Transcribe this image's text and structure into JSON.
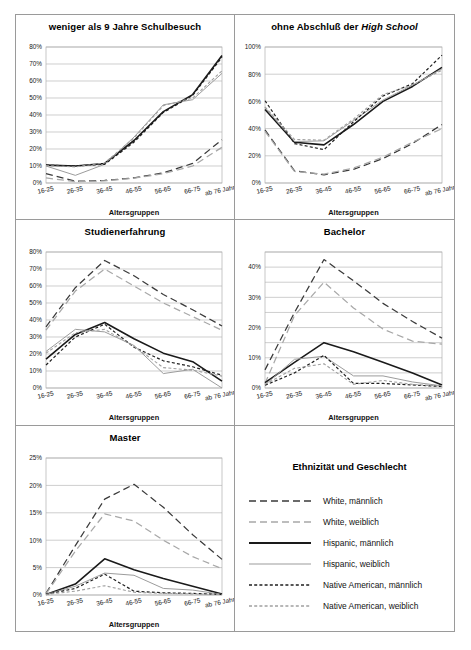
{
  "figure": {
    "axis_caption": "Altersgruppen",
    "categories": [
      "16-25",
      "26-35",
      "36-45",
      "46-55",
      "56-65",
      "66-75",
      "ab 76 Jahre"
    ],
    "series_styles": [
      {
        "key": "white_m",
        "label": "White, männlich",
        "color": "#3a3a3a",
        "width": 1.25,
        "dash": "7,4"
      },
      {
        "key": "white_w",
        "label": "White, weiblich",
        "color": "#a8a8a8",
        "width": 1.25,
        "dash": "7,4"
      },
      {
        "key": "hisp_m",
        "label": "Hispanic, männlich",
        "color": "#1a1a1a",
        "width": 1.6,
        "dash": "none"
      },
      {
        "key": "hisp_w",
        "label": "Hispanic, weiblich",
        "color": "#9c9c9c",
        "width": 1.0,
        "dash": "none"
      },
      {
        "key": "native_m",
        "label": "Native American, männlich",
        "color": "#1f1f1f",
        "width": 1.2,
        "dash": "3,2.2"
      },
      {
        "key": "native_w",
        "label": "Native American, weiblich",
        "color": "#a0a0a0",
        "width": 1.1,
        "dash": "3,2.2"
      }
    ]
  },
  "legend": {
    "title": "Ethnizität und Geschlecht",
    "items": [
      "White, männlich",
      "White, weiblich",
      "Hispanic, männlich",
      "Hispanic, weiblich",
      "Native American, männlich",
      "Native American, weiblich"
    ]
  },
  "chart_data": [
    {
      "id": "schulbesuch",
      "type": "line",
      "title": "weniger als 9 Jahre Schulbesuch",
      "title_italic_part": "",
      "xlabel": "Altersgruppen",
      "ylabel": "",
      "categories": [
        "16-25",
        "26-35",
        "36-45",
        "46-55",
        "56-65",
        "66-75",
        "ab 76 Jahre"
      ],
      "ylim": [
        0,
        80
      ],
      "yticks": [
        0,
        10,
        20,
        30,
        40,
        50,
        60,
        70,
        80
      ],
      "ytick_labels": [
        "0%",
        "10%",
        "20%",
        "30%",
        "40%",
        "50%",
        "60%",
        "70%",
        "80%"
      ],
      "grid": true,
      "series": [
        {
          "name": "White, männlich",
          "key": "white_m",
          "values": [
            5.5,
            1.0,
            1.5,
            3.0,
            6.0,
            11.5,
            25.5
          ]
        },
        {
          "name": "White, weiblich",
          "key": "white_w",
          "values": [
            3.0,
            0.8,
            1.3,
            2.8,
            5.5,
            10.0,
            21.0
          ]
        },
        {
          "name": "Hispanic, männlich",
          "key": "hisp_m",
          "values": [
            10.5,
            10.0,
            11.5,
            25.0,
            42.0,
            52.0,
            75.0
          ]
        },
        {
          "name": "Hispanic, weiblich",
          "key": "hisp_w",
          "values": [
            10.0,
            4.5,
            11.0,
            27.0,
            46.0,
            49.0,
            64.5
          ]
        },
        {
          "name": "Native American, männlich",
          "key": "native_m",
          "values": [
            10.5,
            10.0,
            11.0,
            24.0,
            41.5,
            51.5,
            74.0
          ]
        },
        {
          "name": "Native American, weiblich",
          "key": "native_w",
          "values": [
            10.2,
            9.5,
            11.8,
            26.5,
            45.5,
            50.0,
            66.0
          ]
        }
      ]
    },
    {
      "id": "highschool",
      "type": "line",
      "title": "ohne Abschluß der ",
      "title_italic_part": "High School",
      "xlabel": "Altersgruppen",
      "ylabel": "",
      "categories": [
        "16-25",
        "26-35",
        "36-45",
        "46-55",
        "56-65",
        "66-75",
        "ab 76 Jahre"
      ],
      "ylim": [
        0,
        100
      ],
      "yticks": [
        0,
        20,
        40,
        60,
        80,
        100
      ],
      "ytick_labels": [
        "0%",
        "20%",
        "40%",
        "60%",
        "80%",
        "100%"
      ],
      "grid": true,
      "series": [
        {
          "name": "White, männlich",
          "key": "white_m",
          "values": [
            39.0,
            9.0,
            6.0,
            10.0,
            18.0,
            29.0,
            43.0
          ]
        },
        {
          "name": "White, weiblich",
          "key": "white_w",
          "values": [
            38.0,
            8.5,
            6.5,
            11.0,
            19.0,
            30.0,
            40.0
          ]
        },
        {
          "name": "Hispanic, männlich",
          "key": "hisp_m",
          "values": [
            54.0,
            30.0,
            28.0,
            43.0,
            60.0,
            71.0,
            85.0
          ]
        },
        {
          "name": "Hispanic, weiblich",
          "key": "hisp_w",
          "values": [
            55.5,
            30.5,
            31.0,
            46.0,
            61.0,
            72.0,
            84.0
          ]
        },
        {
          "name": "Native American, männlich",
          "key": "native_m",
          "values": [
            60.5,
            29.0,
            24.5,
            45.0,
            64.0,
            73.0,
            94.0
          ]
        },
        {
          "name": "Native American, weiblich",
          "key": "native_w",
          "values": [
            56.0,
            32.0,
            31.5,
            47.0,
            65.0,
            72.0,
            83.0
          ]
        }
      ]
    },
    {
      "id": "studienerfahrung",
      "type": "line",
      "title": "Studienerfahrung",
      "title_italic_part": "",
      "xlabel": "Altersgruppen",
      "ylabel": "",
      "categories": [
        "16-25",
        "26-35",
        "36-45",
        "46-55",
        "56-65",
        "66-75",
        "ab 76 Jahre"
      ],
      "ylim": [
        0,
        80
      ],
      "yticks": [
        0,
        10,
        20,
        30,
        40,
        50,
        60,
        70,
        80
      ],
      "ytick_labels": [
        "0%",
        "10%",
        "20%",
        "30%",
        "40%",
        "50%",
        "60%",
        "70%",
        "80%"
      ],
      "grid": true,
      "series": [
        {
          "name": "White, männlich",
          "key": "white_m",
          "values": [
            36.0,
            59.0,
            75.0,
            66.0,
            55.0,
            46.0,
            36.5
          ]
        },
        {
          "name": "White, weiblich",
          "key": "white_w",
          "values": [
            34.0,
            57.0,
            70.0,
            60.0,
            50.0,
            42.0,
            34.0
          ]
        },
        {
          "name": "Hispanic, männlich",
          "key": "hisp_m",
          "values": [
            17.0,
            31.5,
            38.5,
            29.0,
            20.5,
            15.5,
            4.0
          ]
        },
        {
          "name": "Hispanic, weiblich",
          "key": "hisp_w",
          "values": [
            21.5,
            34.5,
            33.0,
            25.0,
            8.5,
            11.0,
            0.0
          ]
        },
        {
          "name": "Native American, männlich",
          "key": "native_m",
          "values": [
            13.5,
            30.0,
            37.5,
            24.0,
            16.0,
            12.5,
            7.5
          ]
        },
        {
          "name": "Native American, weiblich",
          "key": "native_w",
          "values": [
            20.5,
            32.5,
            34.5,
            24.5,
            12.0,
            10.5,
            7.0
          ]
        }
      ]
    },
    {
      "id": "bachelor",
      "type": "line",
      "title": "Bachelor",
      "title_italic_part": "",
      "xlabel": "Altersgruppen",
      "ylabel": "",
      "categories": [
        "16-25",
        "26-35",
        "36-45",
        "46-55",
        "56-65",
        "66-75",
        "ab 76 Jahre"
      ],
      "ylim": [
        0,
        45
      ],
      "yticks": [
        0,
        5,
        10,
        15,
        20,
        25,
        30,
        35,
        40,
        45
      ],
      "ytick_labels": [
        "0%",
        "",
        "10%",
        "",
        "20%",
        "",
        "30%",
        "",
        "40%",
        ""
      ],
      "grid": true,
      "series": [
        {
          "name": "White, männlich",
          "key": "white_m",
          "values": [
            6.0,
            25.0,
            42.5,
            35.5,
            28.0,
            22.0,
            16.5
          ]
        },
        {
          "name": "White, weiblich",
          "key": "white_w",
          "values": [
            1.5,
            24.0,
            35.0,
            26.5,
            19.5,
            15.5,
            14.5
          ]
        },
        {
          "name": "Hispanic, männlich",
          "key": "hisp_m",
          "values": [
            1.8,
            8.5,
            15.0,
            12.0,
            8.5,
            5.0,
            1.0
          ]
        },
        {
          "name": "Hispanic, weiblich",
          "key": "hisp_w",
          "values": [
            1.0,
            9.5,
            10.5,
            4.0,
            4.0,
            2.0,
            0.7
          ]
        },
        {
          "name": "Native American, männlich",
          "key": "native_m",
          "values": [
            0.9,
            5.0,
            10.8,
            1.5,
            1.5,
            1.0,
            0.5
          ]
        },
        {
          "name": "Native American, weiblich",
          "key": "native_w",
          "values": [
            1.2,
            6.5,
            8.0,
            1.2,
            2.5,
            1.2,
            0.6
          ]
        }
      ]
    },
    {
      "id": "master",
      "type": "line",
      "title": "Master",
      "title_italic_part": "",
      "xlabel": "Altersgruppen",
      "ylabel": "",
      "categories": [
        "16-25",
        "26-35",
        "36-45",
        "46-55",
        "56-65",
        "66-75",
        "ab 76 Jahre"
      ],
      "ylim": [
        0,
        25
      ],
      "yticks": [
        0,
        5,
        10,
        15,
        20,
        25
      ],
      "ytick_labels": [
        "0%",
        "5%",
        "10%",
        "15%",
        "20%",
        "25%"
      ],
      "grid": true,
      "series": [
        {
          "name": "White, männlich",
          "key": "white_m",
          "values": [
            0.3,
            9.0,
            17.5,
            20.2,
            16.0,
            11.0,
            6.5
          ]
        },
        {
          "name": "White, weiblich",
          "key": "white_w",
          "values": [
            0.2,
            8.0,
            14.8,
            13.5,
            10.0,
            7.0,
            4.8
          ]
        },
        {
          "name": "Hispanic, männlich",
          "key": "hisp_m",
          "values": [
            0.1,
            2.0,
            6.6,
            4.6,
            3.0,
            1.6,
            0.2
          ]
        },
        {
          "name": "Hispanic, weiblich",
          "key": "hisp_w",
          "values": [
            0.1,
            1.6,
            4.0,
            3.6,
            1.2,
            0.9,
            0.1
          ]
        },
        {
          "name": "Native American, männlich",
          "key": "native_m",
          "values": [
            0.1,
            1.2,
            3.8,
            0.7,
            0.4,
            0.3,
            0.1
          ]
        },
        {
          "name": "Native American, weiblich",
          "key": "native_w",
          "values": [
            0.1,
            0.7,
            1.7,
            0.5,
            0.3,
            0.2,
            0.1
          ]
        }
      ]
    }
  ]
}
